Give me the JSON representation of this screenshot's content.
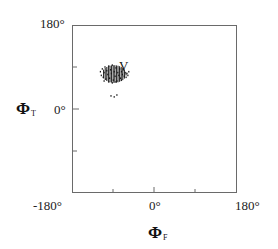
{
  "chart_data": {
    "type": "scatter",
    "title": "",
    "xlabel": "ΦF",
    "ylabel": "ΦT",
    "xlabel_parts": {
      "symbol": "Φ",
      "subscript": "F"
    },
    "ylabel_parts": {
      "symbol": "Φ",
      "subscript": "T"
    },
    "xlim": [
      -180,
      180
    ],
    "ylim": [
      -180,
      180
    ],
    "x_ticks": [
      -180,
      -90,
      0,
      90,
      180
    ],
    "y_ticks": [
      -180,
      -90,
      0,
      90,
      180
    ],
    "x_tick_labels": [
      "-180°",
      "0°",
      "180°"
    ],
    "y_tick_labels": [
      "180°",
      "0°"
    ],
    "grid": false,
    "legend": null,
    "annotations": [
      {
        "text": "V",
        "x": -69,
        "y": 99
      }
    ],
    "clusters": [
      {
        "name": "V",
        "center": {
          "x": -88,
          "y": 75
        },
        "x_range": [
          -121,
          -53
        ],
        "y_range": [
          54,
          96
        ],
        "density": "dense"
      }
    ],
    "series": [
      {
        "name": "V cluster",
        "points": [
          [
            -118,
            80
          ],
          [
            -116,
            72
          ],
          [
            -114,
            86
          ],
          [
            -112,
            68
          ],
          [
            -110,
            78
          ],
          [
            -108,
            90
          ],
          [
            -106,
            64
          ],
          [
            -104,
            82
          ],
          [
            -102,
            74
          ],
          [
            -100,
            92
          ],
          [
            -98,
            66
          ],
          [
            -96,
            84
          ],
          [
            -94,
            76
          ],
          [
            -92,
            94
          ],
          [
            -90,
            62
          ],
          [
            -88,
            80
          ],
          [
            -86,
            70
          ],
          [
            -84,
            88
          ],
          [
            -82,
            60
          ],
          [
            -80,
            78
          ],
          [
            -78,
            72
          ],
          [
            -76,
            86
          ],
          [
            -74,
            66
          ],
          [
            -72,
            80
          ],
          [
            -70,
            74
          ],
          [
            -68,
            84
          ],
          [
            -66,
            70
          ],
          [
            -64,
            78
          ],
          [
            -62,
            68
          ],
          [
            -60,
            76
          ],
          [
            -58,
            72
          ],
          [
            -56,
            80
          ],
          [
            -110,
            60
          ],
          [
            -100,
            58
          ],
          [
            -92,
            56
          ],
          [
            -84,
            58
          ],
          [
            -72,
            62
          ],
          [
            -95,
            28
          ],
          [
            -88,
            26
          ],
          [
            -82,
            30
          ]
        ]
      }
    ]
  },
  "figure": {
    "y_axis": {
      "top_label": "180°",
      "zero_label": "0°",
      "title_symbol": "Φ",
      "title_sub": "T"
    },
    "x_axis": {
      "left_label": "-180°",
      "zero_label": "0°",
      "right_label": "180°",
      "title_symbol": "Φ",
      "title_sub": "F"
    },
    "region_label": "V",
    "colors": {
      "frame": "#6a6a6a",
      "points": "#1a1a1a",
      "background": "#ffffff"
    }
  }
}
